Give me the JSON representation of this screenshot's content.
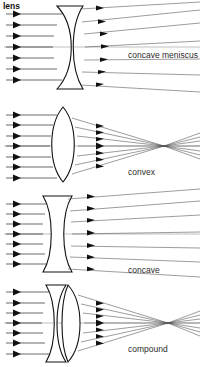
{
  "figure": {
    "title": "lens",
    "width": 205,
    "height": 367,
    "background_color": "#ffffff",
    "line_color": "#111111",
    "text_color": "#2b2b2b"
  },
  "panels": [
    {
      "id": "concave-meniscus",
      "label": "concave meniscus",
      "label_x": 128,
      "label_y": 58,
      "lens_type": "concave meniscus",
      "behavior": "diverging",
      "axis_y": 47,
      "incoming_ray_count": 7,
      "outgoing_ray_count": 7,
      "has_focal_point": false,
      "lens_left_x": 52,
      "lens_right_x": 88,
      "lens_top_y": 6,
      "lens_bottom_y": 89
    },
    {
      "id": "convex",
      "label": "convex",
      "label_x": 128,
      "label_y": 175,
      "lens_type": "biconvex",
      "behavior": "converging",
      "axis_y": 146,
      "incoming_ray_count": 7,
      "outgoing_ray_count": 7,
      "has_focal_point": true,
      "focal_x": 164,
      "focal_y": 146,
      "lens_left_x": 50,
      "lens_right_x": 76,
      "lens_top_y": 107,
      "lens_bottom_y": 182
    },
    {
      "id": "concave",
      "label": "concave",
      "label_x": 128,
      "label_y": 273,
      "lens_type": "biconcave",
      "behavior": "diverging",
      "axis_y": 234,
      "incoming_ray_count": 7,
      "outgoing_ray_count": 7,
      "has_focal_point": false,
      "lens_left_x": 43,
      "lens_right_x": 72,
      "lens_top_y": 196,
      "lens_bottom_y": 272
    },
    {
      "id": "compound",
      "label": "compound",
      "label_x": 128,
      "label_y": 352,
      "lens_type": "compound (meniscus + convex)",
      "behavior": "converging",
      "axis_y": 323,
      "incoming_ray_count": 7,
      "outgoing_ray_count": 7,
      "has_focal_point": true,
      "focal_x": 168,
      "focal_y": 323,
      "lens_left_x": 42,
      "lens_right_x": 84,
      "lens_top_y": 285,
      "lens_bottom_y": 362
    }
  ]
}
